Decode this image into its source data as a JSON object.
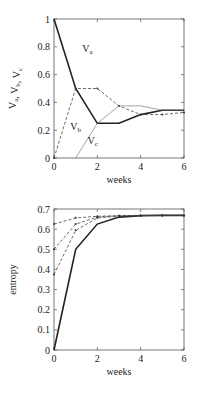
{
  "chart_data": [
    {
      "type": "line",
      "title": "",
      "xlabel": "weeks",
      "ylabel": "V_a, V_b, V_c",
      "xlim": [
        0,
        6
      ],
      "ylim": [
        0,
        1
      ],
      "xticks": [
        "0",
        "2",
        "4",
        "6"
      ],
      "yticks": [
        "0",
        "0.2",
        "0.4",
        "0.6",
        "0.8",
        "1"
      ],
      "grid": false,
      "series": [
        {
          "name": "V_a",
          "style": "solid-thick",
          "x": [
            0,
            1,
            2,
            3,
            4,
            5,
            6
          ],
          "values": [
            1,
            0.5,
            0.25,
            0.25,
            0.3125,
            0.34375,
            0.34375
          ]
        },
        {
          "name": "V_b",
          "style": "dashed",
          "x": [
            0,
            1,
            2,
            3,
            4,
            5,
            6
          ],
          "values": [
            0,
            0.5,
            0.5,
            0.375,
            0.3125,
            0.3125,
            0.328
          ]
        },
        {
          "name": "V_c",
          "style": "solid-thin",
          "x": [
            1,
            2,
            3,
            4,
            5,
            6
          ],
          "values": [
            0,
            0.25,
            0.375,
            0.375,
            0.34375,
            0.34
          ]
        }
      ],
      "annotations": [
        {
          "text": "V_a",
          "x": 1.3,
          "y": 0.76
        },
        {
          "text": "V_b",
          "x": 0.75,
          "y": 0.2
        },
        {
          "text": "V_c",
          "x": 1.55,
          "y": 0.1
        }
      ]
    },
    {
      "type": "line",
      "title": "",
      "xlabel": "weeks",
      "ylabel": "entropy",
      "xlim": [
        0,
        6
      ],
      "ylim": [
        0,
        0.7
      ],
      "xticks": [
        "0",
        "2",
        "4",
        "6"
      ],
      "yticks": [
        "0",
        "0.1",
        "0.2",
        "0.3",
        "0.4",
        "0.5",
        "0.6",
        "0.7"
      ],
      "grid": false,
      "series": [
        {
          "name": "series-1",
          "style": "solid-thick",
          "x": [
            0,
            1,
            2,
            3,
            4,
            5,
            6
          ],
          "values": [
            0,
            0.5,
            0.625,
            0.66,
            0.667,
            0.668,
            0.668
          ]
        },
        {
          "name": "series-2",
          "style": "dashed",
          "x": [
            0,
            1,
            2,
            3,
            4,
            5,
            6
          ],
          "values": [
            0.375,
            0.594,
            0.656,
            0.664,
            0.667,
            0.668,
            0.668
          ]
        },
        {
          "name": "series-3",
          "style": "dashed",
          "x": [
            0,
            1,
            2,
            3,
            4,
            5,
            6
          ],
          "values": [
            0.5,
            0.625,
            0.66,
            0.666,
            0.667,
            0.668,
            0.668
          ]
        },
        {
          "name": "series-4",
          "style": "dashed",
          "x": [
            0,
            1,
            2,
            3,
            4,
            5,
            6
          ],
          "values": [
            0.625,
            0.656,
            0.664,
            0.667,
            0.668,
            0.668,
            0.668
          ]
        }
      ]
    }
  ]
}
